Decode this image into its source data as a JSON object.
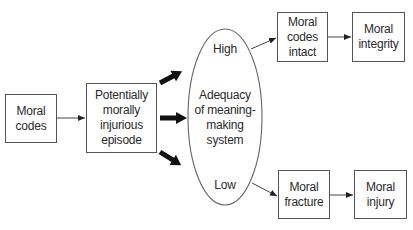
{
  "diagram": {
    "nodes": {
      "moral_codes": {
        "lines": [
          "Moral",
          "codes"
        ]
      },
      "episode": {
        "lines": [
          "Potentially",
          "morally",
          "injurious",
          "episode"
        ]
      },
      "meaning_system": {
        "high_label": "High",
        "center_lines": [
          "Adequacy",
          "of meaning-",
          "making",
          "system"
        ],
        "low_label": "Low"
      },
      "codes_intact": {
        "lines": [
          "Moral",
          "codes",
          "intact"
        ]
      },
      "integrity": {
        "lines": [
          "Moral",
          "integrity"
        ]
      },
      "fracture": {
        "lines": [
          "Moral",
          "fracture"
        ]
      },
      "injury": {
        "lines": [
          "Moral",
          "injury"
        ]
      }
    },
    "edges": [
      {
        "from": "moral_codes",
        "to": "episode",
        "style": "thin"
      },
      {
        "from": "episode",
        "to": "meaning_system",
        "style": "bold",
        "direction": "up"
      },
      {
        "from": "episode",
        "to": "meaning_system",
        "style": "bold",
        "direction": "right"
      },
      {
        "from": "episode",
        "to": "meaning_system",
        "style": "bold",
        "direction": "down"
      },
      {
        "from": "meaning_system.high",
        "to": "codes_intact",
        "style": "thin"
      },
      {
        "from": "codes_intact",
        "to": "integrity",
        "style": "thin"
      },
      {
        "from": "meaning_system.low",
        "to": "fracture",
        "style": "thin"
      },
      {
        "from": "fracture",
        "to": "injury",
        "style": "thin"
      }
    ],
    "colors": {
      "line": "#555555",
      "bold_arrow": "#111111",
      "text": "#2a2a2a"
    }
  }
}
